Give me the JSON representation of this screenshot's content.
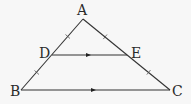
{
  "diagram": {
    "type": "geometry-triangle-midsegment",
    "background": "#f7f7f7",
    "stroke_color": "#333333",
    "vertices": {
      "A": {
        "label": "A",
        "x": 83,
        "y": 19,
        "label_x": 77,
        "label_y": 15
      },
      "B": {
        "label": "B",
        "x": 21,
        "y": 90,
        "label_x": 10,
        "label_y": 96
      },
      "C": {
        "label": "C",
        "x": 170,
        "y": 90,
        "label_x": 172,
        "label_y": 96
      },
      "D": {
        "label": "D",
        "x": 52,
        "y": 55,
        "label_x": 39,
        "label_y": 58
      },
      "E": {
        "label": "E",
        "x": 127,
        "y": 55,
        "label_x": 131,
        "label_y": 58
      }
    },
    "segments": [
      {
        "from": "A",
        "to": "B"
      },
      {
        "from": "A",
        "to": "C"
      },
      {
        "from": "B",
        "to": "C",
        "arrow": true
      },
      {
        "from": "D",
        "to": "E",
        "arrow": true
      }
    ],
    "equal_marks": [
      {
        "segment": "AD",
        "marks": 1
      },
      {
        "segment": "DB",
        "marks": 1
      },
      {
        "segment": "AE",
        "marks": 1
      },
      {
        "segment": "EC",
        "marks": 1
      }
    ],
    "relations": [
      "DE ∥ BC",
      "AD = DB",
      "AE = EC"
    ]
  }
}
